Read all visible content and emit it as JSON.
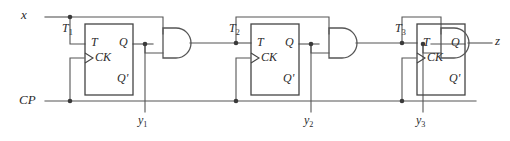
{
  "diagram": {
    "type": "logic-circuit-schematic",
    "line_color": "#555555",
    "box_color": "#444444",
    "text_color": "#2b2b2b",
    "background": "#ffffff",
    "inputs": [
      {
        "name": "x",
        "label": "x",
        "y": 17
      },
      {
        "name": "CP",
        "label": "CP",
        "y": 101
      }
    ],
    "outputs": [
      {
        "name": "z",
        "label": "z",
        "y": 43
      }
    ],
    "flipflops": [
      {
        "id": "ff1",
        "t_label": "T",
        "ck_label": "CK",
        "q_label": "Q",
        "qprime_label": "Q'",
        "input_signal_label": "T",
        "input_signal_sub": "1",
        "output_signal_label": "y",
        "output_signal_sub": "1"
      },
      {
        "id": "ff2",
        "t_label": "T",
        "ck_label": "CK",
        "q_label": "Q",
        "qprime_label": "Q'",
        "input_signal_label": "T",
        "input_signal_sub": "2",
        "output_signal_label": "y",
        "output_signal_sub": "2"
      },
      {
        "id": "ff3",
        "t_label": "T",
        "ck_label": "CK",
        "q_label": "Q",
        "qprime_label": "Q'",
        "input_signal_label": "T",
        "input_signal_sub": "3",
        "output_signal_label": "y",
        "output_signal_sub": "3"
      }
    ],
    "gates": [
      {
        "id": "and1",
        "kind": "AND",
        "inputs": 2
      },
      {
        "id": "and2",
        "kind": "AND",
        "inputs": 2
      },
      {
        "id": "and3",
        "kind": "AND",
        "inputs": 2
      }
    ]
  }
}
